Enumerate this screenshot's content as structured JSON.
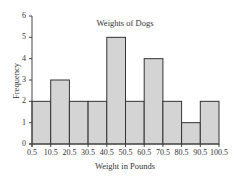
{
  "chart_data": {
    "type": "bar",
    "subtype": "histogram",
    "title": "Weights of Dogs",
    "xlabel": "Weight in Pounds",
    "ylabel": "Frequency",
    "bin_edges": [
      0.5,
      10.5,
      20.5,
      30.5,
      40.5,
      50.5,
      60.5,
      70.5,
      80.5,
      90.5,
      100.5
    ],
    "categories": [
      "0.5-10.5",
      "10.5-20.5",
      "20.5-30.5",
      "30.5-40.5",
      "40.5-50.5",
      "50.5-60.5",
      "60.5-70.5",
      "70.5-80.5",
      "80.5-90.5",
      "90.5-100.5"
    ],
    "values": [
      2,
      3,
      2,
      2,
      5,
      2,
      4,
      2,
      1,
      2
    ],
    "ylim": [
      0,
      6
    ],
    "yticks": [
      0,
      1,
      2,
      3,
      4,
      5,
      6
    ],
    "xtick_labels": [
      "0.5",
      "10.5",
      "20.5",
      "30.5",
      "40.5",
      "50.5",
      "60.5",
      "70.5",
      "80.5",
      "90.5",
      "100.5"
    ],
    "grid": false,
    "legend": null,
    "colors": {
      "bar_fill": "#d4d4d4",
      "bar_stroke": "#333333",
      "axis": "#444444"
    }
  }
}
